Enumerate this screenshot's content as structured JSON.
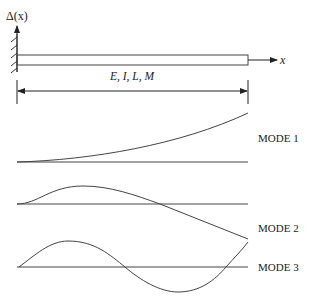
{
  "figure": {
    "axis_label": "Δ(x)",
    "x_axis_label": "x",
    "beam_properties_label": "E, I, L, M",
    "modes": [
      {
        "label": "MODE 1"
      },
      {
        "label": "MODE 2"
      },
      {
        "label": "MODE 3"
      }
    ],
    "colors": {
      "stroke": "#333333",
      "background": "#ffffff"
    }
  }
}
